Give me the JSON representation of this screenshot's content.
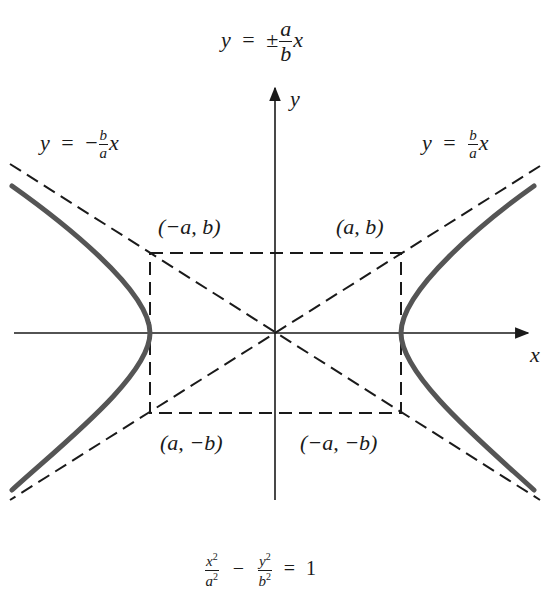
{
  "title_equation": {
    "lhs": "y",
    "eq": "=",
    "pm": "±",
    "num": "a",
    "den": "b",
    "var": "x",
    "text": "y = ±(a/b)x"
  },
  "asymptote_left_label": {
    "lhs": "y",
    "eq": "=",
    "sign": "−",
    "num": "b",
    "den": "a",
    "var": "x",
    "text": "y = −(b/a)x"
  },
  "asymptote_right_label": {
    "lhs": "y",
    "eq": "=",
    "num": "b",
    "den": "a",
    "var": "x",
    "text": "y = (b/a)x"
  },
  "axes": {
    "x_label": "x",
    "y_label": "y"
  },
  "corner_labels": {
    "top_left": "(−a, b)",
    "top_right": "(a, b)",
    "bottom_left": "(a, −b)",
    "bottom_right": "(−a, −b)"
  },
  "bottom_equation": {
    "x_num": "x",
    "x_den": "a",
    "minus": "−",
    "y_num": "y",
    "y_den": "b",
    "eq": "=",
    "rhs": "1",
    "exp": "2",
    "text": "x²/a² − y²/b² = 1"
  },
  "colors": {
    "curve": "#555555",
    "lines": "#1a1a1a",
    "background": "#ffffff"
  },
  "geometry": {
    "origin": [
      275,
      333
    ],
    "a_px": 126,
    "b_px": 80
  }
}
